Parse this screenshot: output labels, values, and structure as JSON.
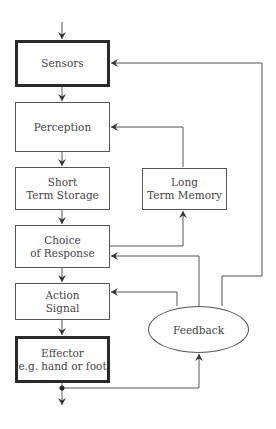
{
  "diagram": {
    "type": "flowchart",
    "nodes": {
      "sensors": {
        "line1": "Sensors",
        "line2": ""
      },
      "perception": {
        "line1": "Perception",
        "line2": ""
      },
      "short_term_storage": {
        "line1": "Short",
        "line2": "Term Storage"
      },
      "long_term_memory": {
        "line1": "Long",
        "line2": "Term Memory"
      },
      "choice_of_response": {
        "line1": "Choice",
        "line2": "of Response"
      },
      "action_signal": {
        "line1": "Action",
        "line2": "Signal"
      },
      "effector": {
        "line1": "Effector",
        "line2": "e.g. hand or foot"
      },
      "feedback": {
        "label": "Feedback"
      }
    },
    "edges": [
      {
        "from": "input",
        "to": "sensors"
      },
      {
        "from": "sensors",
        "to": "perception"
      },
      {
        "from": "perception",
        "to": "short_term_storage"
      },
      {
        "from": "short_term_storage",
        "to": "choice_of_response"
      },
      {
        "from": "choice_of_response",
        "to": "long_term_memory"
      },
      {
        "from": "long_term_memory",
        "to": "perception"
      },
      {
        "from": "choice_of_response",
        "to": "action_signal"
      },
      {
        "from": "action_signal",
        "to": "effector"
      },
      {
        "from": "effector",
        "to": "output"
      },
      {
        "from": "effector",
        "to": "feedback"
      },
      {
        "from": "feedback",
        "to": "action_signal"
      },
      {
        "from": "feedback",
        "to": "choice_of_response"
      },
      {
        "from": "feedback",
        "to": "sensors"
      }
    ],
    "colors": {
      "line": "#555555",
      "thick_border": "#2a2a2a"
    }
  }
}
